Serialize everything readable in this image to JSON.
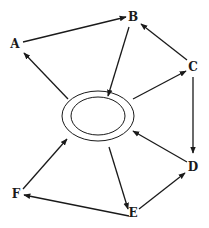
{
  "diagram": {
    "type": "directed-graph",
    "colors": {
      "stroke": "#1a1a1a",
      "background": "#ffffff"
    },
    "center": {
      "label": "",
      "shape": "double-ellipse",
      "cx": 98,
      "cy": 116,
      "outer": {
        "rx": 36,
        "ry": 25
      },
      "inner": {
        "rx": 27,
        "ry": 19
      }
    },
    "nodes": [
      {
        "id": "A",
        "label": "A",
        "x": 15,
        "y": 48
      },
      {
        "id": "B",
        "label": "B",
        "x": 133,
        "y": 21
      },
      {
        "id": "C",
        "label": "C",
        "x": 193,
        "y": 71
      },
      {
        "id": "D",
        "label": "D",
        "x": 193,
        "y": 171
      },
      {
        "id": "E",
        "label": "E",
        "x": 133,
        "y": 217
      },
      {
        "id": "F",
        "label": "F",
        "x": 16,
        "y": 198
      }
    ],
    "edges": [
      {
        "from": "A",
        "to": "B",
        "x1": 23,
        "y1": 42,
        "x2": 126,
        "y2": 17
      },
      {
        "from": "B",
        "to": "center",
        "x1": 129,
        "y1": 27,
        "x2": 108,
        "y2": 96
      },
      {
        "from": "center",
        "to": "A",
        "x1": 68,
        "y1": 99,
        "x2": 24,
        "y2": 53
      },
      {
        "from": "C",
        "to": "B",
        "x1": 187,
        "y1": 60,
        "x2": 141,
        "y2": 24
      },
      {
        "from": "center",
        "to": "C",
        "x1": 133,
        "y1": 99,
        "x2": 186,
        "y2": 71
      },
      {
        "from": "C",
        "to": "D",
        "x1": 193,
        "y1": 77,
        "x2": 193,
        "y2": 153
      },
      {
        "from": "D",
        "to": "center",
        "x1": 187,
        "y1": 162,
        "x2": 133,
        "y2": 131
      },
      {
        "from": "E",
        "to": "D",
        "x1": 139,
        "y1": 209,
        "x2": 185,
        "y2": 173
      },
      {
        "from": "center",
        "to": "E",
        "x1": 109,
        "y1": 147,
        "x2": 128,
        "y2": 209
      },
      {
        "from": "E",
        "to": "F",
        "x1": 129,
        "y1": 216,
        "x2": 24,
        "y2": 195
      },
      {
        "from": "F",
        "to": "center",
        "x1": 23,
        "y1": 189,
        "x2": 67,
        "y2": 139
      }
    ]
  }
}
